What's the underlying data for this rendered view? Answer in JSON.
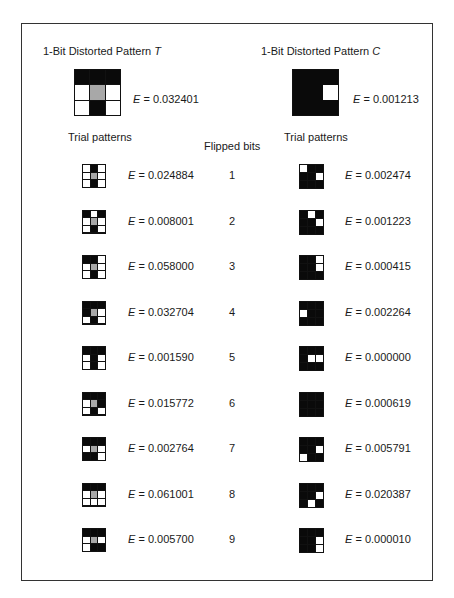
{
  "figure": {
    "left": {
      "title_prefix": "1-Bit Distorted Pattern ",
      "title_letter": "T",
      "pattern": [
        "BBB",
        "WGW",
        "WBW"
      ],
      "energy_label": "E",
      "energy_value": "= 0.032401",
      "trial_header": "Trial patterns"
    },
    "right": {
      "title_prefix": "1-Bit Distorted Pattern ",
      "title_letter": "C",
      "pattern": [
        "BBB",
        "BBW",
        "BBB"
      ],
      "energy_label": "E",
      "energy_value": "= 0.001213",
      "trial_header": "Trial patterns"
    },
    "flipped_header": "Flipped bits",
    "rows": [
      {
        "flipped": "1",
        "t_pattern": [
          "WBW",
          "WGW",
          "WBW"
        ],
        "t_energy": "= 0.024884",
        "c_pattern": [
          "WBB",
          "BBW",
          "BBB"
        ],
        "c_energy": "= 0.002474"
      },
      {
        "flipped": "2",
        "t_pattern": [
          "BWB",
          "WGW",
          "WBW"
        ],
        "t_energy": "= 0.008001",
        "c_pattern": [
          "BWB",
          "BBW",
          "BBB"
        ],
        "c_energy": "= 0.001223"
      },
      {
        "flipped": "3",
        "t_pattern": [
          "BBW",
          "WGW",
          "WBW"
        ],
        "t_energy": "= 0.058000",
        "c_pattern": [
          "BBW",
          "BBW",
          "BBB"
        ],
        "c_energy": "= 0.000415"
      },
      {
        "flipped": "4",
        "t_pattern": [
          "BBB",
          "BGW",
          "WBW"
        ],
        "t_energy": "= 0.032704",
        "c_pattern": [
          "BBB",
          "WBB",
          "BBB"
        ],
        "c_energy": "= 0.002264"
      },
      {
        "flipped": "5",
        "t_pattern": [
          "BBB",
          "WBW",
          "WBW"
        ],
        "t_energy": "= 0.001590",
        "c_pattern": [
          "BBB",
          "BWW",
          "BBB"
        ],
        "c_energy": "= 0.000000"
      },
      {
        "flipped": "6",
        "t_pattern": [
          "BBB",
          "WGB",
          "WBW"
        ],
        "t_energy": "= 0.015772",
        "c_pattern": [
          "BBB",
          "BBB",
          "BBB"
        ],
        "c_energy": "= 0.000619"
      },
      {
        "flipped": "7",
        "t_pattern": [
          "BBB",
          "WGW",
          "BBW"
        ],
        "t_energy": "= 0.002764",
        "c_pattern": [
          "BBB",
          "BBW",
          "WBB"
        ],
        "c_energy": "= 0.005791"
      },
      {
        "flipped": "8",
        "t_pattern": [
          "BBB",
          "WGW",
          "WWW"
        ],
        "t_energy": "= 0.061001",
        "c_pattern": [
          "BBB",
          "BBW",
          "BWB"
        ],
        "c_energy": "= 0.020387"
      },
      {
        "flipped": "9",
        "t_pattern": [
          "BBB",
          "WGW",
          "WBB"
        ],
        "t_energy": "= 0.005700",
        "c_pattern": [
          "BBB",
          "BBW",
          "BBW"
        ],
        "c_energy": "= 0.000010"
      }
    ],
    "colors": {
      "black": "#0a0a0a",
      "grey": "#a8a8a8",
      "white": "#ffffff",
      "border": "#333333"
    }
  }
}
